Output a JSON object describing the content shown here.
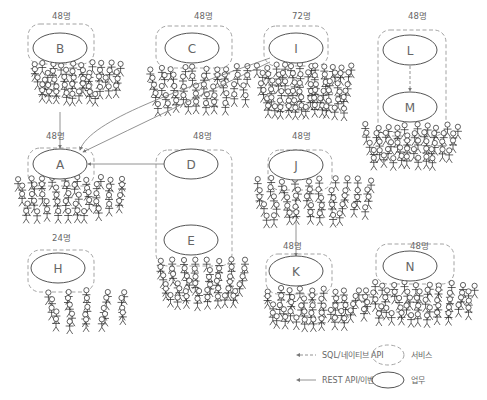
{
  "colors": {
    "service_border": "#999999",
    "task_border": "#555555",
    "arrow": "#777777",
    "text": "#666666",
    "person": "#222222"
  },
  "services": [
    {
      "id": "svc-B",
      "count": "48명",
      "box": [
        28,
        24,
        66,
        40
      ],
      "count_pos": [
        52,
        19
      ]
    },
    {
      "id": "svc-C",
      "count": "48명",
      "box": [
        156,
        26,
        76,
        42
      ],
      "count_pos": [
        194,
        19
      ]
    },
    {
      "id": "svc-I",
      "count": "72명",
      "box": [
        264,
        26,
        64,
        40
      ],
      "count_pos": [
        292,
        19
      ]
    },
    {
      "id": "svc-L",
      "count": "48명",
      "box": [
        378,
        30,
        68,
        106
      ],
      "count_pos": [
        408,
        19
      ]
    },
    {
      "id": "svc-A",
      "count": "48명",
      "box": [
        28,
        148,
        66,
        38
      ],
      "count_pos": [
        46,
        139
      ]
    },
    {
      "id": "svc-D",
      "count": "48명",
      "box": [
        156,
        150,
        76,
        116
      ],
      "count_pos": [
        193,
        139
      ]
    },
    {
      "id": "svc-J",
      "count": "48명",
      "box": [
        268,
        150,
        64,
        40
      ],
      "count_pos": [
        292,
        139
      ]
    },
    {
      "id": "svc-H",
      "count": "24명",
      "box": [
        28,
        250,
        66,
        42
      ],
      "count_pos": [
        52,
        241
      ]
    },
    {
      "id": "svc-K",
      "count": "48명",
      "box": [
        266,
        254,
        66,
        40
      ],
      "count_pos": [
        283,
        249
      ]
    },
    {
      "id": "svc-N",
      "count": "48명",
      "box": [
        376,
        244,
        78,
        40
      ],
      "count_pos": [
        410,
        249
      ]
    }
  ],
  "tasks": [
    {
      "id": "B",
      "label": "B",
      "cx": 60,
      "cy": 48,
      "rx": 27,
      "ry": 15
    },
    {
      "id": "C",
      "label": "C",
      "cx": 192,
      "cy": 48,
      "rx": 27,
      "ry": 15
    },
    {
      "id": "I",
      "label": "I",
      "cx": 296,
      "cy": 48,
      "rx": 27,
      "ry": 15
    },
    {
      "id": "L",
      "label": "L",
      "cx": 410,
      "cy": 50,
      "rx": 27,
      "ry": 15
    },
    {
      "id": "M",
      "label": "M",
      "cx": 410,
      "cy": 107,
      "rx": 27,
      "ry": 15
    },
    {
      "id": "A",
      "label": "A",
      "cx": 60,
      "cy": 164,
      "rx": 27,
      "ry": 15
    },
    {
      "id": "D",
      "label": "D",
      "cx": 191,
      "cy": 164,
      "rx": 27,
      "ry": 15
    },
    {
      "id": "E",
      "label": "E",
      "cx": 191,
      "cy": 240,
      "rx": 27,
      "ry": 15
    },
    {
      "id": "J",
      "label": "J",
      "cx": 296,
      "cy": 165,
      "rx": 27,
      "ry": 15
    },
    {
      "id": "H",
      "label": "H",
      "cx": 58,
      "cy": 268,
      "rx": 27,
      "ry": 15
    },
    {
      "id": "K",
      "label": "K",
      "cx": 296,
      "cy": 271,
      "rx": 27,
      "ry": 15
    },
    {
      "id": "N",
      "label": "N",
      "cx": 410,
      "cy": 266,
      "rx": 27,
      "ry": 15
    }
  ],
  "crowds": [
    {
      "near": "B",
      "x": 30,
      "y": 60,
      "w": 95,
      "h": 42,
      "n": 48
    },
    {
      "near": "C",
      "x": 145,
      "y": 64,
      "w": 110,
      "h": 48,
      "n": 48
    },
    {
      "near": "I",
      "x": 255,
      "y": 62,
      "w": 100,
      "h": 55,
      "n": 72
    },
    {
      "near": "M",
      "x": 362,
      "y": 122,
      "w": 100,
      "h": 45,
      "n": 48
    },
    {
      "near": "A",
      "x": 14,
      "y": 174,
      "w": 115,
      "h": 46,
      "n": 48
    },
    {
      "near": "E",
      "x": 155,
      "y": 257,
      "w": 95,
      "h": 50,
      "n": 48
    },
    {
      "near": "J",
      "x": 252,
      "y": 176,
      "w": 125,
      "h": 48,
      "n": 48
    },
    {
      "near": "H",
      "x": 40,
      "y": 288,
      "w": 95,
      "h": 42,
      "n": 24
    },
    {
      "near": "K",
      "x": 262,
      "y": 286,
      "w": 112,
      "h": 42,
      "n": 48
    },
    {
      "near": "N",
      "x": 368,
      "y": 280,
      "w": 110,
      "h": 44,
      "n": 48
    }
  ],
  "edges": [
    {
      "from": "B",
      "to": "A",
      "style": "solid",
      "path": "M60 112 L60 148"
    },
    {
      "from": "I",
      "to": "A",
      "style": "solid",
      "path": "M270 58 C 180 90, 90 120, 80 150"
    },
    {
      "from": "I",
      "to": "A",
      "style": "solid",
      "path": "M270 62 Q 170 110, 83 152"
    },
    {
      "from": "D",
      "to": "A",
      "style": "solid",
      "path": "M164 164 L88 164"
    },
    {
      "from": "L",
      "to": "M",
      "style": "dashed",
      "path": "M410 66 L410 91"
    },
    {
      "from": "J",
      "to": "K",
      "style": "solid",
      "path": "M296 222 L296 256"
    }
  ],
  "legend": {
    "items": [
      {
        "kind": "dashed-arrow",
        "label": "SQL/네이티브 API",
        "x": 300,
        "y": 355
      },
      {
        "kind": "solid-arrow",
        "label": "REST API/이벤트",
        "x": 300,
        "y": 380
      },
      {
        "kind": "service-shape",
        "label": "서비스",
        "x": 405,
        "y": 355
      },
      {
        "kind": "task-shape",
        "label": "업무",
        "x": 405,
        "y": 380
      }
    ]
  }
}
